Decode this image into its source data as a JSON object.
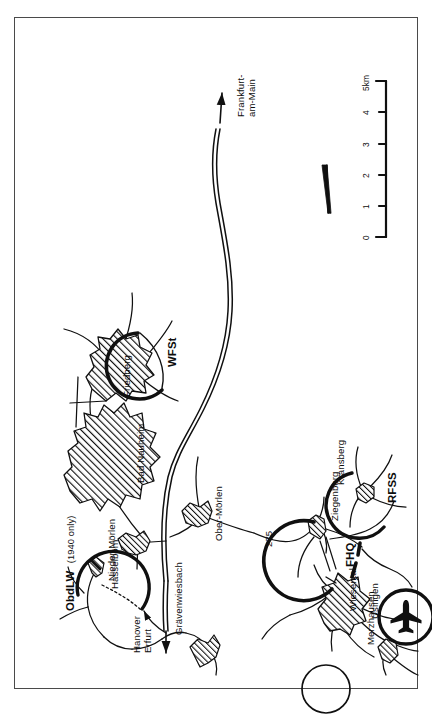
{
  "figure": {
    "kind": "historical-map",
    "title_on_image": "",
    "frame_color": "#4a4a4a",
    "ink_color": "#0d0d0d",
    "paper_color": "#ffffff",
    "orientation_note": "map printed sideways (rotated 90 degrees) on the page"
  },
  "map": {
    "places": [
      {
        "id": "nieder-moerlen",
        "label": "Nieder-Mörlen",
        "type": "town"
      },
      {
        "id": "bad-nauheim",
        "label": "Bad Nauheim",
        "type": "town"
      },
      {
        "id": "friedberg",
        "label": "Friedberg",
        "type": "town"
      },
      {
        "id": "ober-moerlen",
        "label": "Ober-Mörlen",
        "type": "town"
      },
      {
        "id": "ziegenberg",
        "label": "Ziegenberg",
        "type": "village"
      },
      {
        "id": "wiesental",
        "label": "Wiesental",
        "type": "village"
      },
      {
        "id": "kransberg",
        "label": "Kransberg",
        "type": "village"
      },
      {
        "id": "usingen",
        "label": "Usingen",
        "type": "town"
      },
      {
        "id": "merzhausen",
        "label": "Merzhausen",
        "type": "village"
      },
      {
        "id": "hasselborn",
        "label": "Hasselborn",
        "type": "village"
      },
      {
        "id": "graevenwiesbach",
        "label": "Grävenwiesbach",
        "type": "village"
      }
    ],
    "installations": [
      {
        "id": "fhq",
        "label": "FHQ",
        "note": "",
        "site": "Ziegenberg"
      },
      {
        "id": "rfss",
        "label": "RFSS",
        "note": "",
        "site": "Kransberg"
      },
      {
        "id": "wfst",
        "label": "WFSt",
        "note": "",
        "site": "Friedberg"
      },
      {
        "id": "obdlw",
        "label": "ObdLW",
        "note": "(1940 only)",
        "site": "Hasselborn / Grävenwiesbach"
      }
    ],
    "roads": [
      {
        "id": "r275",
        "label": "275",
        "type": "road-number"
      }
    ],
    "directions": [
      {
        "id": "dir-north",
        "lines": [
          "Hanover",
          "Erfurt"
        ],
        "arrow": "north-west"
      },
      {
        "id": "dir-south",
        "lines": [
          "Frankfurt-",
          "am-Main"
        ],
        "arrow": "south-east"
      }
    ],
    "airfield": {
      "id": "merzhausen-airfield",
      "icon": "airplane-icon",
      "at": "Merzhausen"
    },
    "scale_bar": {
      "ticks": [
        "0",
        "1",
        "2",
        "3",
        "4"
      ],
      "unit_label": "5km",
      "max_km": 5
    },
    "compass": {
      "icon": "compass-needle-icon",
      "points_to": "north"
    }
  }
}
